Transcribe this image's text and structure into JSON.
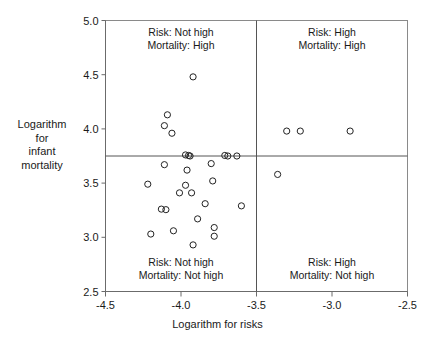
{
  "chart_data": {
    "type": "scatter",
    "title": "",
    "xlabel": "Logarithm for risks",
    "ylabel": "Logarithm for infant mortality",
    "ylabel_lines": [
      "Logarithm",
      "for",
      "infant",
      "mortality"
    ],
    "xlim": [
      -4.5,
      -2.5
    ],
    "ylim": [
      2.5,
      5.0
    ],
    "xticks": [
      -4.5,
      -4.0,
      -3.5,
      -3.0,
      -2.5
    ],
    "xticklabels": [
      "-4.5",
      "-4.0",
      "-3.5",
      "-3.0",
      "-2.5"
    ],
    "yticks": [
      2.5,
      3.0,
      3.5,
      4.0,
      4.5,
      5.0
    ],
    "yticklabels": [
      "2.5",
      "3.0",
      "3.5",
      "4.0",
      "4.5",
      "5.0"
    ],
    "grid": false,
    "legend": null,
    "marker": "open-circle",
    "marker_color": "#222222",
    "reference_lines": [
      {
        "orientation": "vertical",
        "value": -3.5,
        "color": "#555555"
      },
      {
        "orientation": "horizontal",
        "value": 3.75,
        "color": "#555555"
      }
    ],
    "quadrant_annotations": [
      {
        "position": "top-left",
        "lines": [
          "Risk: Not high",
          "Mortality: High"
        ]
      },
      {
        "position": "top-right",
        "lines": [
          "Risk: High",
          "Mortality: High"
        ]
      },
      {
        "position": "bottom-left",
        "lines": [
          "Risk: Not high",
          "Mortality: Not high"
        ]
      },
      {
        "position": "bottom-right",
        "lines": [
          "Risk: High",
          "Mortality: Not high"
        ]
      }
    ],
    "points": [
      {
        "x": -3.92,
        "y": 4.48
      },
      {
        "x": -4.09,
        "y": 4.13
      },
      {
        "x": -4.11,
        "y": 4.03
      },
      {
        "x": -4.06,
        "y": 3.96
      },
      {
        "x": -3.3,
        "y": 3.98
      },
      {
        "x": -3.21,
        "y": 3.98
      },
      {
        "x": -2.88,
        "y": 3.98
      },
      {
        "x": -3.97,
        "y": 3.76
      },
      {
        "x": -3.95,
        "y": 3.755
      },
      {
        "x": -3.94,
        "y": 3.75
      },
      {
        "x": -3.71,
        "y": 3.755
      },
      {
        "x": -3.69,
        "y": 3.75
      },
      {
        "x": -3.63,
        "y": 3.75
      },
      {
        "x": -4.11,
        "y": 3.67
      },
      {
        "x": -3.8,
        "y": 3.68
      },
      {
        "x": -3.96,
        "y": 3.62
      },
      {
        "x": -3.36,
        "y": 3.58
      },
      {
        "x": -4.22,
        "y": 3.49
      },
      {
        "x": -3.97,
        "y": 3.48
      },
      {
        "x": -3.79,
        "y": 3.52
      },
      {
        "x": -4.01,
        "y": 3.41
      },
      {
        "x": -3.93,
        "y": 3.41
      },
      {
        "x": -3.84,
        "y": 3.31
      },
      {
        "x": -3.6,
        "y": 3.29
      },
      {
        "x": -4.13,
        "y": 3.26
      },
      {
        "x": -4.1,
        "y": 3.255
      },
      {
        "x": -3.89,
        "y": 3.17
      },
      {
        "x": -3.78,
        "y": 3.09
      },
      {
        "x": -4.05,
        "y": 3.06
      },
      {
        "x": -4.2,
        "y": 3.03
      },
      {
        "x": -3.78,
        "y": 3.01
      },
      {
        "x": -3.92,
        "y": 2.93
      }
    ]
  },
  "axis_labels": {
    "x_title": "Logarithm for risks",
    "y_title_lines": [
      "Logarithm",
      "for",
      "infant",
      "mortality"
    ]
  }
}
